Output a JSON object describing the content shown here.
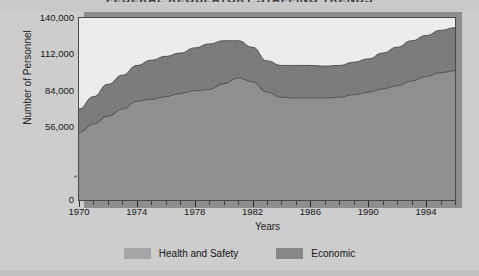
{
  "chart_data": {
    "type": "area",
    "title": "FEDERAL REGULATORY STAFFING TRENDS",
    "xlabel": "Years",
    "ylabel": "Number of Personnel",
    "xlim": [
      1970,
      1996
    ],
    "ylim": [
      0,
      140000
    ],
    "ytick_labels": [
      "0",
      "56,000",
      "84,000",
      "112,000",
      "140,000"
    ],
    "ytick_values": [
      0,
      56000,
      84000,
      112000,
      140000
    ],
    "xtick_labels": [
      "1970",
      "1974",
      "1978",
      "1982",
      "1986",
      "1990",
      "1994"
    ],
    "xtick_values": [
      1970,
      1974,
      1978,
      1982,
      1986,
      1990,
      1994
    ],
    "minor_tick_interval": 1,
    "grid": false,
    "stacked": true,
    "legend_position": "bottom-center",
    "axis_note": "*",
    "x": [
      1970,
      1971,
      1972,
      1973,
      1974,
      1975,
      1976,
      1977,
      1978,
      1979,
      1980,
      1981,
      1982,
      1983,
      1984,
      1985,
      1986,
      1987,
      1988,
      1989,
      1990,
      1991,
      1992,
      1993,
      1994,
      1995,
      1996
    ],
    "series": [
      {
        "name": "Economic",
        "color": "#8f8f8f",
        "values": [
          52000,
          58500,
          64500,
          70000,
          76000,
          77500,
          79500,
          82000,
          84000,
          85000,
          89500,
          94000,
          91000,
          83000,
          79000,
          78500,
          78500,
          78500,
          79000,
          81000,
          83000,
          85500,
          88000,
          91500,
          95000,
          98000,
          99500
        ]
      },
      {
        "name": "Health and Safety",
        "color": "#7c7c7c",
        "values": [
          18000,
          21000,
          24500,
          26000,
          27500,
          30000,
          31000,
          31000,
          33000,
          35000,
          33000,
          28500,
          26500,
          24000,
          24500,
          25000,
          25000,
          24500,
          24500,
          25000,
          25500,
          27500,
          29500,
          31000,
          31500,
          32500,
          33000
        ]
      }
    ],
    "totals": [
      70000,
      79500,
      89000,
      96000,
      103500,
      107500,
      110500,
      113000,
      117000,
      120000,
      122500,
      122500,
      117500,
      107000,
      103500,
      103500,
      103500,
      103000,
      103500,
      106000,
      108500,
      113000,
      117500,
      122500,
      126500,
      130500,
      132500
    ]
  },
  "legend": {
    "items": [
      {
        "label": "Health and Safety",
        "color": "#a6a6a6"
      },
      {
        "label": "Economic",
        "color": "#878787"
      }
    ]
  },
  "colors": {
    "page_background": "#cdcdcd",
    "plot_background": "#ececec",
    "axis": "#3d3d3d",
    "shadow": "#8e8e8e",
    "text": "#171717"
  }
}
